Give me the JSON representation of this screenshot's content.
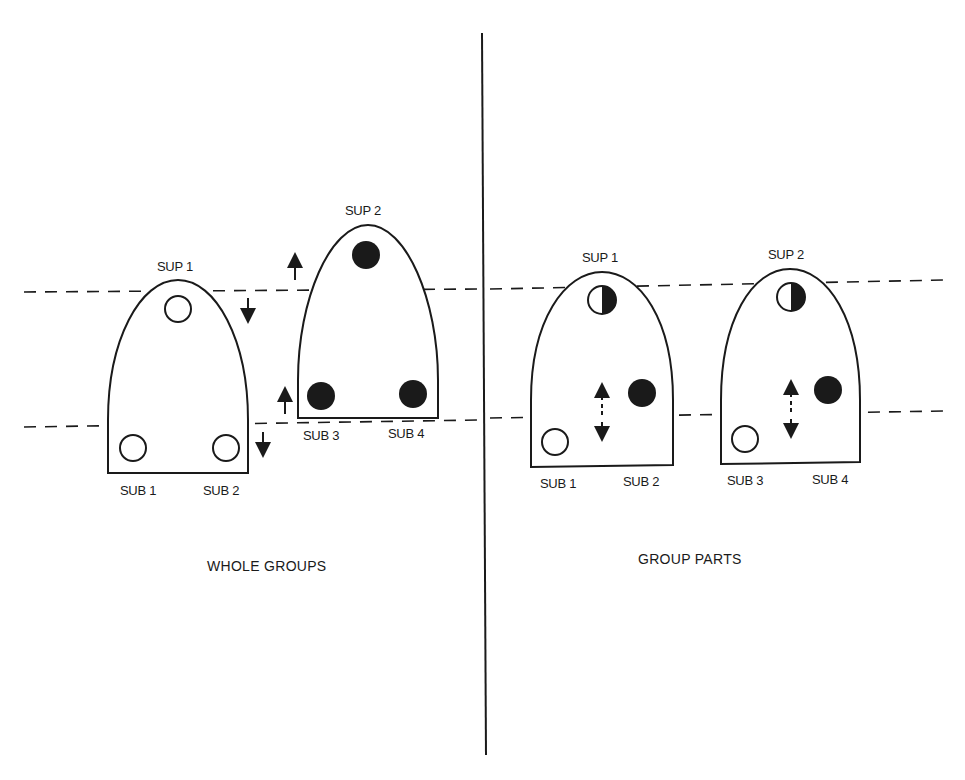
{
  "left_panel": {
    "caption": "WHOLE GROUPS",
    "groups": [
      {
        "top_label": "SUP 1",
        "top_marker": "open",
        "bottom_labels": [
          "SUB 1",
          "SUB 2"
        ],
        "bottom_markers": [
          "open",
          "open"
        ]
      },
      {
        "top_label": "SUP 2",
        "top_marker": "filled",
        "bottom_labels": [
          "SUB 3",
          "SUB 4"
        ],
        "bottom_markers": [
          "filled",
          "filled"
        ]
      }
    ]
  },
  "right_panel": {
    "caption": "GROUP PARTS",
    "groups": [
      {
        "top_label": "SUP 1",
        "top_marker": "half",
        "bottom_labels": [
          "SUB 1",
          "SUB 2"
        ],
        "bottom_markers": [
          "open",
          "filled"
        ]
      },
      {
        "top_label": "SUP 2",
        "top_marker": "half",
        "bottom_labels": [
          "SUB 3",
          "SUB 4"
        ],
        "bottom_markers": [
          "open",
          "filled"
        ]
      }
    ]
  },
  "colors": {
    "ink": "#1a1a1a",
    "background": "#ffffff"
  }
}
